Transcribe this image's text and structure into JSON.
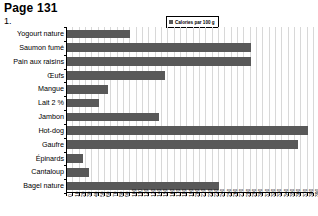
{
  "header": {
    "page_label": "Page 131",
    "question_number": "1."
  },
  "legend": {
    "label": "Calories par 100 g",
    "swatch_icon": "square-swatch-icon",
    "swatch_color": "#595959"
  },
  "chart_data": {
    "type": "bar",
    "orientation": "horizontal",
    "title": "",
    "subtitle": "",
    "xlabel": "",
    "ylabel": "",
    "legend_entries": [
      "Calories par 100 g"
    ],
    "legend_position": "top-right",
    "grid": true,
    "bar_color": "#595959",
    "xlim": [
      0,
      390
    ],
    "xtick_step": 10,
    "xticks": [
      0,
      10,
      20,
      30,
      40,
      50,
      60,
      70,
      80,
      90,
      100,
      110,
      120,
      130,
      140,
      150,
      160,
      170,
      180,
      190,
      200,
      210,
      220,
      230,
      240,
      250,
      260,
      270,
      280,
      290,
      300,
      310,
      320,
      330,
      340,
      350,
      360,
      370,
      380,
      390
    ],
    "categories": [
      "Yogourt nature",
      "Saumon fumé",
      "Pain aux raisins",
      "Œufs",
      "Mangue",
      "Lait 2 %",
      "Jambon",
      "Hot-dog",
      "Gaufre",
      "Épinards",
      "Cantaloup",
      "Bagel nature"
    ],
    "values": [
      100,
      290,
      290,
      155,
      65,
      50,
      145,
      380,
      365,
      25,
      35,
      240
    ],
    "series": [
      {
        "name": "Calories par 100 g",
        "values": [
          100,
          290,
          290,
          155,
          65,
          50,
          145,
          380,
          365,
          25,
          35,
          240
        ]
      }
    ]
  }
}
